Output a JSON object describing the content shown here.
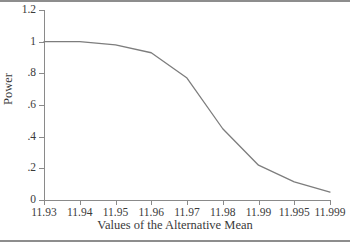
{
  "chart_data": {
    "type": "line",
    "title": "",
    "xlabel": "Values of the Alternative Mean",
    "ylabel": "Power",
    "categories": [
      "11.93",
      "11.94",
      "11.95",
      "11.96",
      "11.97",
      "11.98",
      "11.99",
      "11.995",
      "11.999"
    ],
    "values": [
      1.0,
      1.0,
      0.98,
      0.93,
      0.77,
      0.45,
      0.22,
      0.115,
      0.05
    ],
    "series": [
      {
        "name": "Power",
        "values": [
          1.0,
          1.0,
          0.98,
          0.93,
          0.77,
          0.45,
          0.22,
          0.115,
          0.05
        ]
      }
    ],
    "yticks": [
      "0",
      ".2",
      ".4",
      ".6",
      ".8",
      "1",
      "1.2"
    ],
    "ytick_values": [
      0,
      0.2,
      0.4,
      0.6,
      0.8,
      1.0,
      1.2
    ],
    "ylim": [
      0,
      1.2
    ],
    "xlim": [
      0,
      8
    ],
    "grid": false,
    "legend": false,
    "line_color": "#7d7d7d"
  },
  "axes": {
    "x_title": "Values of the Alternative Mean",
    "y_title": "Power"
  }
}
